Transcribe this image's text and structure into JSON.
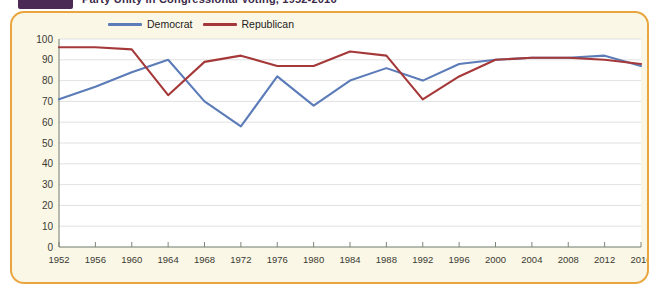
{
  "header": {
    "tab_marker": "chapter-tab",
    "title": "Party Unity in Congressional Voting, 1952-2016"
  },
  "panel": {
    "border_color": "#e9a63f",
    "background_color": "#fbf7e6"
  },
  "chart_data": {
    "type": "line",
    "title": "Party Unity in Congressional Voting, 1952-2016",
    "xlabel": "",
    "ylabel": "",
    "ylim": [
      0,
      100
    ],
    "ytick_step": 10,
    "yticks": [
      0,
      10,
      20,
      30,
      40,
      50,
      60,
      70,
      80,
      90,
      100
    ],
    "grid": true,
    "legend_position": "top-left",
    "categories": [
      "1952",
      "1956",
      "1960",
      "1964",
      "1968",
      "1972",
      "1976",
      "1980",
      "1984",
      "1988",
      "1992",
      "1996",
      "2000",
      "2004",
      "2008",
      "2012",
      "2016"
    ],
    "series": [
      {
        "name": "Democrat",
        "color": "#5b7cb8",
        "values": [
          71,
          77,
          84,
          90,
          70,
          58,
          82,
          68,
          80,
          86,
          80,
          88,
          90,
          91,
          91,
          92,
          87
        ]
      },
      {
        "name": "Republican",
        "color": "#a5393a",
        "values": [
          96,
          96,
          95,
          73,
          89,
          92,
          87,
          87,
          94,
          92,
          71,
          82,
          90,
          91,
          91,
          90,
          88
        ]
      }
    ]
  }
}
